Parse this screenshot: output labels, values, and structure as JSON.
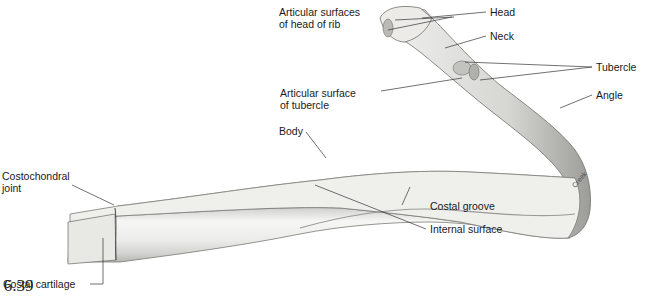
{
  "figure": {
    "caption": "e 6.39",
    "signature": "Creek",
    "labels": {
      "articular_surfaces_head": "Articular surfaces\nof head of rib",
      "articular_surfaces_head_l1": "Articular surfaces",
      "articular_surfaces_head_l2": "of head of rib",
      "head": "Head",
      "neck": "Neck",
      "tubercle": "Tubercle",
      "articular_surface_tubercle_l1": "Articular surface",
      "articular_surface_tubercle_l2": "of tubercle",
      "angle": "Angle",
      "body": "Body",
      "costochondral_joint_l1": "Costochondral",
      "costochondral_joint_l2": "joint",
      "costal_groove": "Costal groove",
      "internal_surface": "Internal surface",
      "costal_cartilage": "Costal cartilage"
    },
    "colors": {
      "bone_light": "#f4f4f2",
      "bone_mid": "#d9d9d6",
      "bone_dark": "#a8a8a4",
      "outline": "#6e6e6a",
      "leader": "#333333"
    }
  }
}
